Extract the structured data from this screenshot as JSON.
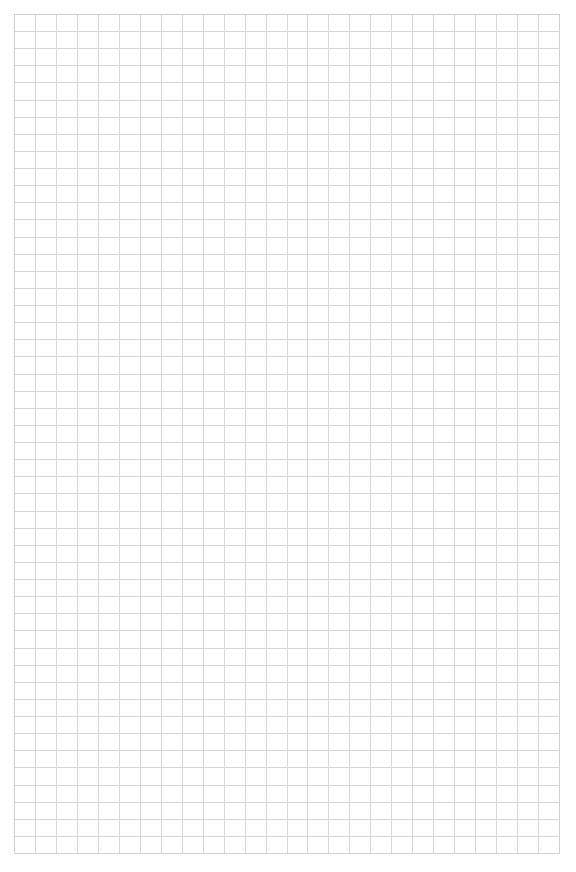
{
  "page": {
    "type": "grid-paper",
    "background": "#ffffff",
    "content_text": ""
  },
  "grid": {
    "left": 14,
    "top": 14,
    "right": 559,
    "bottom": 853,
    "columns": 26,
    "rows": 49,
    "line_color": "#d6d6d6",
    "border_color": "#cfcfcf",
    "line_width": 1
  }
}
